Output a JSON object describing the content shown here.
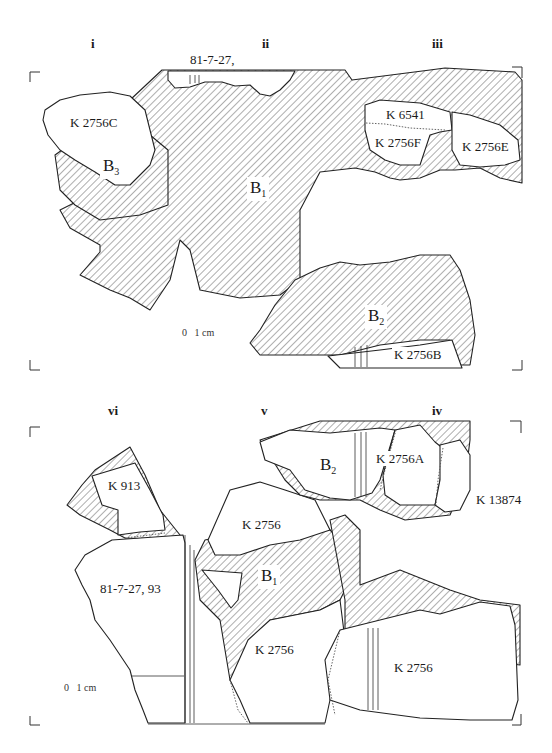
{
  "figure": {
    "upper_panel": {
      "column_labels": [
        "i",
        "ii",
        "iii"
      ],
      "top_label": "81-7-27,",
      "fragments": [
        "K 2756C",
        "K 6541",
        "K 2756F",
        "K 2756E",
        "K 2756B"
      ],
      "restorations": [
        {
          "letter": "B",
          "sub": "1"
        },
        {
          "letter": "B",
          "sub": "2"
        },
        {
          "letter": "B",
          "sub": "3"
        }
      ],
      "scale": {
        "zero": "0",
        "unit": "1 cm"
      }
    },
    "lower_panel": {
      "column_labels": [
        "vi",
        "v",
        "iv"
      ],
      "fragments": [
        "K 913",
        "81-7-27, 93",
        "K 2756",
        "K 2756A",
        "K 13874",
        "K 2756",
        "K 2756"
      ],
      "restorations": [
        {
          "letter": "B",
          "sub": "1"
        },
        {
          "letter": "B",
          "sub": "2"
        }
      ],
      "scale": {
        "zero": "0",
        "unit": "1 cm"
      }
    },
    "colors": {
      "line": "#222222",
      "hatch": "#333333",
      "background": "#ffffff"
    }
  }
}
